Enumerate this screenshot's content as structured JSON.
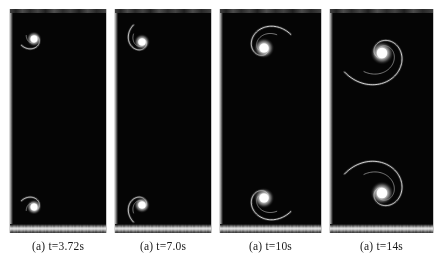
{
  "figure": {
    "kind": "image-sequence",
    "background_color": "#ffffff",
    "panel_color": "#050505",
    "filament_color": "#dedede",
    "core_color": "#ffffff",
    "panel_count": 4
  },
  "panels": [
    {
      "id": "panel-1",
      "caption": "(a) t=3.72s",
      "x": 9,
      "width": 98,
      "vortices": [
        {
          "name": "upper-vortex",
          "cx": 24,
          "cy": 30,
          "turns": 1.35,
          "r_max": 14,
          "handed": "cw",
          "core_r": 3.4
        },
        {
          "name": "lower-vortex",
          "cx": 24,
          "cy": 198,
          "turns": 1.35,
          "r_max": 14,
          "handed": "ccw",
          "core_r": 3.4
        }
      ]
    },
    {
      "id": "panel-2",
      "caption": "(a) t=7.0s",
      "x": 114,
      "width": 98,
      "vortices": [
        {
          "name": "upper-vortex",
          "cx": 27,
          "cy": 33,
          "turns": 1.6,
          "r_max": 19,
          "handed": "cw",
          "core_r": 3.6
        },
        {
          "name": "lower-vortex",
          "cx": 27,
          "cy": 196,
          "turns": 1.6,
          "r_max": 19,
          "handed": "ccw",
          "core_r": 3.6
        }
      ]
    },
    {
      "id": "panel-3",
      "caption": "(a) t=10s",
      "x": 219,
      "width": 103,
      "vortices": [
        {
          "name": "upper-vortex",
          "cx": 44,
          "cy": 39,
          "turns": 1.85,
          "r_max": 30,
          "handed": "cw",
          "core_r": 4.6
        },
        {
          "name": "lower-vortex",
          "cx": 44,
          "cy": 189,
          "turns": 1.85,
          "r_max": 30,
          "handed": "ccw",
          "core_r": 4.6
        }
      ]
    },
    {
      "id": "panel-4",
      "caption": "(a) t=14s",
      "x": 329,
      "width": 105,
      "vortices": [
        {
          "name": "upper-vortex",
          "cx": 52,
          "cy": 44,
          "turns": 2.35,
          "r_max": 42,
          "handed": "cw",
          "core_r": 5.2
        },
        {
          "name": "lower-vortex",
          "cx": 52,
          "cy": 184,
          "turns": 2.35,
          "r_max": 42,
          "handed": "ccw",
          "core_r": 5.2
        }
      ]
    }
  ]
}
